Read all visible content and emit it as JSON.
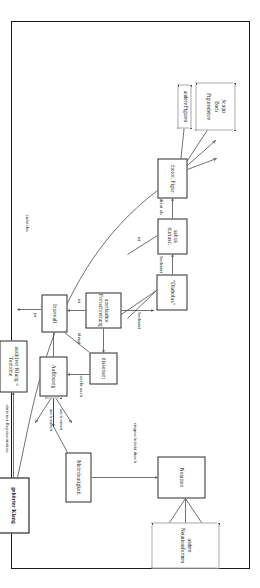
{
  "diagram": {
    "type": "concept-map",
    "language": "de",
    "orientation": "rotated-90",
    "nodes": [
      {
        "id": "rhetor_figur",
        "label": "rhetor. Figur",
        "style": "box"
      },
      {
        "id": "saltus",
        "label": "saltus duriusc.",
        "style": "box"
      },
      {
        "id": "diabolus",
        "label": "\"Diabolus\"",
        "style": "box"
      },
      {
        "id": "unerlaubte",
        "label": "unerlaubte Fortschreitung",
        "style": "box"
      },
      {
        "id": "dissonant",
        "label": "dissonant",
        "style": "box"
      },
      {
        "id": "aufloesung",
        "label": "Auflösung",
        "style": "box"
      },
      {
        "id": "mehrdeutigkeit",
        "label": "Mehrdeutigkeit",
        "style": "box"
      },
      {
        "id": "notation",
        "label": "Notation",
        "style": "box"
      },
      {
        "id": "intervall",
        "label": "Intervall",
        "style": "box"
      },
      {
        "id": "auditiver_klang",
        "label": "auditiver Klang = Tonhöhe",
        "style": "box"
      },
      {
        "id": "gehoerter_klang",
        "label": "gehörter Klang",
        "style": "box-bold"
      }
    ],
    "groups": [
      {
        "id": "figurenlehre",
        "style": "dotted",
        "lines": [
          "Schütz",
          "Bach",
          "Figurenlehre"
        ]
      },
      {
        "id": "andere_figuren",
        "style": "dotted",
        "lines": [
          "andere Figuren"
        ]
      },
      {
        "id": "andere_notationsformen",
        "style": "dotted",
        "lines": [
          "andere Notationsformen"
        ]
      },
      {
        "id": "andere_intervalle",
        "style": "dotted",
        "lines": [
          "andere Intervalle"
        ]
      }
    ],
    "edge_labels": [
      {
        "id": "dient_als",
        "text": "dient als"
      },
      {
        "id": "bedeutet_1",
        "text": "bedeutet"
      },
      {
        "id": "bedeutet_2",
        "text": "bedeutet"
      },
      {
        "id": "ist_1",
        "text": "ist"
      },
      {
        "id": "ist_2",
        "text": "ist"
      },
      {
        "id": "ist_3",
        "text": "ist"
      },
      {
        "id": "klingt",
        "text": "klingt"
      },
      {
        "id": "strebt_nach",
        "text": "strebt nach"
      },
      {
        "id": "nach_innen",
        "text": "nach innen"
      },
      {
        "id": "nach_aussen",
        "text": "nach außen"
      },
      {
        "id": "eingeschraenkt",
        "text": "eingeschränkt durch"
      },
      {
        "id": "sieht_das",
        "text": "sieht das"
      },
      {
        "id": "aktiviert",
        "text": "aktiviert Repräsentation"
      }
    ]
  }
}
